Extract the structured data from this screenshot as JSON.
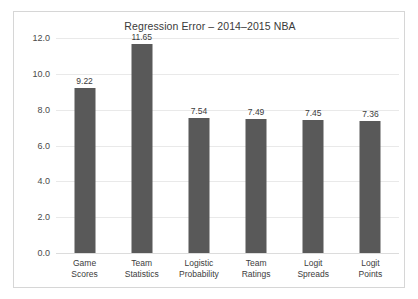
{
  "chart_data": {
    "type": "bar",
    "title": "Regression Error – 2014–2015 NBA",
    "xlabel": "",
    "ylabel": "",
    "categories": [
      "Game Scores",
      "Team Statistics",
      "Logistic Probability",
      "Team Ratings",
      "Logit Spreads",
      "Logit Points"
    ],
    "category_lines": [
      [
        "Game",
        "Scores"
      ],
      [
        "Team",
        "Statistics"
      ],
      [
        "Logistic",
        "Probability"
      ],
      [
        "Team",
        "Ratings"
      ],
      [
        "Logit",
        "Spreads"
      ],
      [
        "Logit",
        "Points"
      ]
    ],
    "values": [
      9.22,
      11.65,
      7.54,
      7.49,
      7.45,
      7.36
    ],
    "value_labels": [
      "9.22",
      "11.65",
      "7.54",
      "7.49",
      "7.45",
      "7.36"
    ],
    "ylim": [
      0.0,
      12.0
    ],
    "ytick_values": [
      0.0,
      2.0,
      4.0,
      6.0,
      8.0,
      10.0,
      12.0
    ],
    "ytick_labels": [
      "0.0",
      "2.0",
      "4.0",
      "6.0",
      "8.0",
      "10.0",
      "12.0"
    ],
    "grid": true,
    "legend": false,
    "legend_position": "none",
    "colors": {
      "bar": "#595959",
      "gridline": "#e9e9e9",
      "baseline": "#dcdcdc",
      "frame": "#d6d6d6",
      "background": "#ffffff",
      "title_text": "#3a3a3a",
      "tick_text": "#3c3c3c"
    }
  }
}
